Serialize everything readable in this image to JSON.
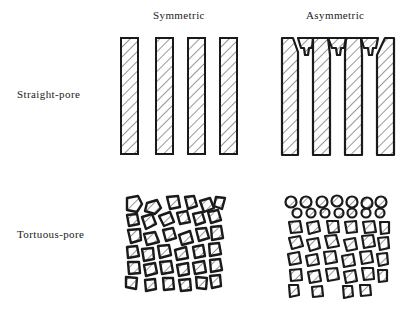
{
  "columns": [
    {
      "id": "symmetric",
      "label": "Symmetric"
    },
    {
      "id": "asymmetric",
      "label": "Asymmetric"
    }
  ],
  "rows": [
    {
      "id": "straight-pore",
      "label": "Straight-pore"
    },
    {
      "id": "tortuous-pore",
      "label": "Tortuous-pore"
    }
  ],
  "panels": [
    {
      "row": "straight-pore",
      "column": "symmetric",
      "depiction": "four parallel hatched rectangular walls of uniform width"
    },
    {
      "row": "straight-pore",
      "column": "asymmetric",
      "depiction": "four parallel hatched walls with narrowed pore openings (thin skin layer) at the top"
    },
    {
      "row": "tortuous-pore",
      "column": "symmetric",
      "depiction": "randomly packed irregular hatched particles of uniform size"
    },
    {
      "row": "tortuous-pore",
      "column": "asymmetric",
      "depiction": "two layers of small round particles on top of larger irregular hatched particles"
    }
  ],
  "colors": {
    "ink": "#1a1a1a",
    "background": "#ffffff"
  }
}
